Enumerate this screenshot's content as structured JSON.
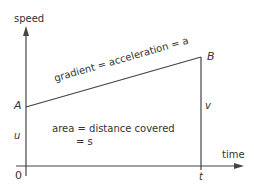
{
  "diagram": {
    "axes": {
      "y_label": "speed",
      "x_label": "time",
      "origin_label": "0"
    },
    "points": {
      "A": {
        "label": "A"
      },
      "B": {
        "label": "B"
      }
    },
    "values": {
      "initial_speed": "u",
      "final_speed": "v",
      "time": "t"
    },
    "annotations": {
      "gradient": "gradient = acceleration = a",
      "area_line1": "area = distance covered",
      "area_line2": "= s"
    },
    "colors": {
      "line": "#444444",
      "text": "#333333",
      "background": "#ffffff"
    }
  }
}
